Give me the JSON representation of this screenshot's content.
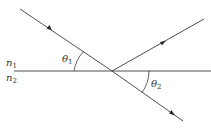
{
  "diagram": {
    "type": "ray-refraction-reflection",
    "interface": {
      "upper_medium": {
        "symbol": "n",
        "sub": "1"
      },
      "lower_medium": {
        "symbol": "n",
        "sub": "2"
      }
    },
    "angles": {
      "incident": {
        "symbol": "θ",
        "sub": "1"
      },
      "refracted": {
        "symbol": "θ",
        "sub": "2"
      }
    },
    "rays": [
      {
        "name": "incident",
        "direction": "toward-interface"
      },
      {
        "name": "reflected",
        "direction": "away-from-interface"
      },
      {
        "name": "refracted",
        "direction": "away-from-interface"
      }
    ],
    "colors": {
      "stroke": "#3a3a3a",
      "background": "#ffffff"
    }
  }
}
